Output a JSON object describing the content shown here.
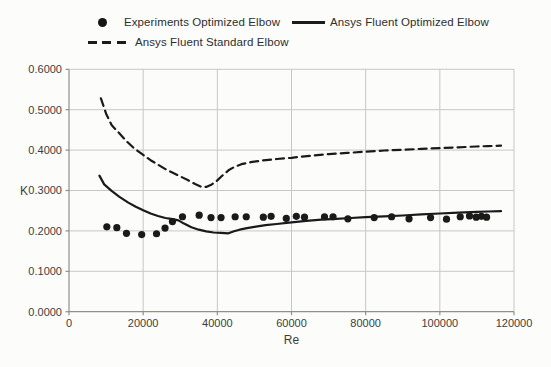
{
  "legend": {
    "items": [
      {
        "label": "Experiments Optimized Elbow",
        "marker": "black-dot"
      },
      {
        "label": "Ansys Fluent Optimized Elbow",
        "marker": "solid-line"
      },
      {
        "label": "Ansys Fluent Standard Elbow",
        "marker": "dashed-line"
      }
    ]
  },
  "chart_data": {
    "type": "line",
    "title": "",
    "xlabel": "Re",
    "ylabel": "K",
    "xlim": [
      0,
      120000
    ],
    "ylim": [
      0,
      0.6
    ],
    "xticks": [
      0,
      20000,
      40000,
      60000,
      80000,
      100000,
      120000
    ],
    "yticks": [
      0,
      0.1,
      0.2,
      0.3,
      0.4,
      0.5,
      0.6
    ],
    "ytick_decimals": 4,
    "grid": true,
    "legend_position": "top",
    "colors": {
      "series": "#1a1a1a",
      "grid": "#c7c7c4",
      "axis": "#8f8f8c",
      "text": "#3c3c3c"
    },
    "series": [
      {
        "name": "Experiments Optimized Elbow",
        "type": "scatter",
        "points": [
          [
            10200,
            0.21
          ],
          [
            12900,
            0.208
          ],
          [
            15500,
            0.194
          ],
          [
            19600,
            0.191
          ],
          [
            23600,
            0.193
          ],
          [
            25900,
            0.207
          ],
          [
            27900,
            0.223
          ],
          [
            30600,
            0.235
          ],
          [
            35100,
            0.239
          ],
          [
            38300,
            0.233
          ],
          [
            41000,
            0.233
          ],
          [
            44800,
            0.235
          ],
          [
            47800,
            0.235
          ],
          [
            52400,
            0.234
          ],
          [
            54500,
            0.236
          ],
          [
            58600,
            0.231
          ],
          [
            61300,
            0.236
          ],
          [
            63500,
            0.234
          ],
          [
            68900,
            0.235
          ],
          [
            71200,
            0.235
          ],
          [
            75200,
            0.23
          ],
          [
            82300,
            0.233
          ],
          [
            87000,
            0.235
          ],
          [
            91700,
            0.23
          ],
          [
            97500,
            0.233
          ],
          [
            101800,
            0.229
          ],
          [
            105500,
            0.235
          ],
          [
            108000,
            0.237
          ],
          [
            109800,
            0.234
          ],
          [
            111200,
            0.236
          ],
          [
            112600,
            0.234
          ]
        ]
      },
      {
        "name": "Ansys Fluent Optimized Elbow",
        "type": "line",
        "style": "solid",
        "points": [
          [
            8200,
            0.337
          ],
          [
            9500,
            0.315
          ],
          [
            11500,
            0.299
          ],
          [
            13500,
            0.285
          ],
          [
            16000,
            0.27
          ],
          [
            18000,
            0.26
          ],
          [
            20000,
            0.251
          ],
          [
            22000,
            0.243
          ],
          [
            24000,
            0.237
          ],
          [
            26000,
            0.232
          ],
          [
            28000,
            0.229
          ],
          [
            29500,
            0.226
          ],
          [
            31000,
            0.218
          ],
          [
            33000,
            0.209
          ],
          [
            35000,
            0.203
          ],
          [
            37000,
            0.199
          ],
          [
            39000,
            0.196
          ],
          [
            41000,
            0.195
          ],
          [
            43000,
            0.194
          ],
          [
            44500,
            0.199
          ],
          [
            46000,
            0.203
          ],
          [
            48000,
            0.207
          ],
          [
            50000,
            0.21
          ],
          [
            53000,
            0.214
          ],
          [
            56000,
            0.217
          ],
          [
            60000,
            0.221
          ],
          [
            64000,
            0.225
          ],
          [
            68000,
            0.228
          ],
          [
            72000,
            0.23
          ],
          [
            76000,
            0.232
          ],
          [
            80000,
            0.234
          ],
          [
            85000,
            0.236
          ],
          [
            90000,
            0.238
          ],
          [
            95000,
            0.241
          ],
          [
            100000,
            0.243
          ],
          [
            105000,
            0.245
          ],
          [
            110000,
            0.247
          ],
          [
            113000,
            0.248
          ],
          [
            116500,
            0.249
          ]
        ]
      },
      {
        "name": "Ansys Fluent Standard Elbow",
        "type": "line",
        "style": "dashed",
        "points": [
          [
            8600,
            0.528
          ],
          [
            10000,
            0.49
          ],
          [
            11500,
            0.462
          ],
          [
            13500,
            0.442
          ],
          [
            15500,
            0.422
          ],
          [
            17500,
            0.405
          ],
          [
            20000,
            0.388
          ],
          [
            22000,
            0.375
          ],
          [
            24000,
            0.364
          ],
          [
            26000,
            0.353
          ],
          [
            28000,
            0.344
          ],
          [
            30000,
            0.335
          ],
          [
            32000,
            0.326
          ],
          [
            34000,
            0.316
          ],
          [
            35500,
            0.31
          ],
          [
            37000,
            0.309
          ],
          [
            38500,
            0.315
          ],
          [
            40000,
            0.325
          ],
          [
            41500,
            0.338
          ],
          [
            43000,
            0.35
          ],
          [
            44500,
            0.358
          ],
          [
            46500,
            0.365
          ],
          [
            49000,
            0.37
          ],
          [
            52000,
            0.374
          ],
          [
            56000,
            0.378
          ],
          [
            60000,
            0.381
          ],
          [
            65000,
            0.386
          ],
          [
            70000,
            0.39
          ],
          [
            75000,
            0.393
          ],
          [
            80000,
            0.396
          ],
          [
            85000,
            0.399
          ],
          [
            90000,
            0.401
          ],
          [
            95000,
            0.403
          ],
          [
            100000,
            0.405
          ],
          [
            105000,
            0.407
          ],
          [
            110000,
            0.409
          ],
          [
            113000,
            0.41
          ],
          [
            116500,
            0.411
          ]
        ]
      }
    ]
  }
}
